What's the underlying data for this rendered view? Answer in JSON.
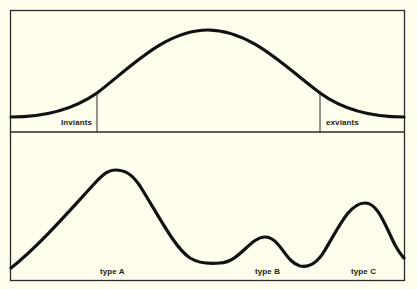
{
  "diagram": {
    "colors": {
      "background": "#fffdec",
      "stroke": "#111111",
      "frame": "#2a2a2a"
    },
    "top_panel": {
      "labels": {
        "inviants": "Inviants",
        "exviants": "exviants"
      }
    },
    "bottom_panel": {
      "labels": {
        "type_a": "type A",
        "type_b": "type B",
        "type_c": "type C"
      }
    }
  }
}
